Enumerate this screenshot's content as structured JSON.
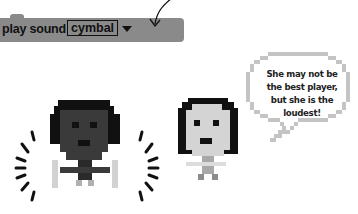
{
  "code_block": {
    "label": "play sound",
    "dropdown_value": "cymbal",
    "color": "#8a8a8a"
  },
  "speech_bubble": {
    "text": "She may not be the best player, but she is the loudest!"
  },
  "characters": [
    {
      "name": "drummer",
      "description": "dark-skinned pixel character with shaking lines"
    },
    {
      "name": "girl",
      "description": "light-skinned pixel character with dark hair"
    }
  ],
  "icons": {
    "arrow": "curved-arrow-icon",
    "caret": "chevron-down-icon"
  }
}
